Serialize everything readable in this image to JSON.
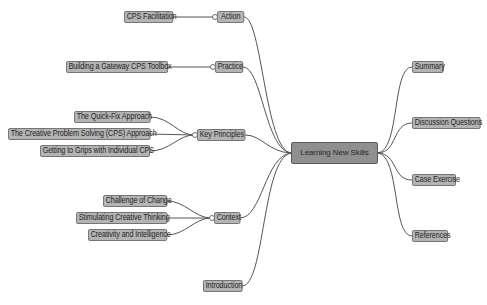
{
  "mindmap": {
    "root": {
      "label": "Learning New Skills"
    },
    "left_branches": [
      {
        "label": "Action",
        "children": [
          "CPS Facilitation"
        ]
      },
      {
        "label": "Practice",
        "children": [
          "Building a Gateway CPS Toolbox"
        ]
      },
      {
        "label": "Key Principles",
        "children": [
          "The Quick-Fix Approach",
          "The Creative Problem Solving (CPS) Approach",
          "Getting to Grips with Individual CPS"
        ]
      },
      {
        "label": "Context",
        "children": [
          "Challenge of Change",
          "Stimulating Creative Thinking",
          "Creativity and Intelligence"
        ]
      },
      {
        "label": "Introduction",
        "children": []
      }
    ],
    "right_branches": [
      {
        "label": "Summary"
      },
      {
        "label": "Discussion Questions"
      },
      {
        "label": "Case Exercise"
      },
      {
        "label": "References"
      }
    ]
  },
  "colors": {
    "node_fill": "#b4b4b4",
    "root_fill": "#8f8f8f",
    "node_border": "#6e6e6e",
    "link": "#555555",
    "background": "#ffffff"
  }
}
